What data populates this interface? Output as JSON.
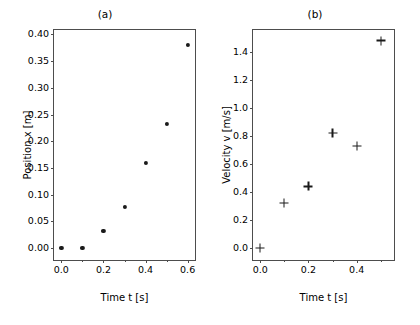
{
  "figure": {
    "width": 420,
    "height": 325,
    "background": "#ffffff",
    "marker_color": "#1a1a1a",
    "axis_color": "#4d4d4d"
  },
  "chart_data": [
    {
      "type": "scatter",
      "title": "(a)",
      "xlabel": "Time t [s]",
      "ylabel": "Position x [m]",
      "xlim": [
        -0.035,
        0.635
      ],
      "ylim": [
        -0.022,
        0.408
      ],
      "xticks": [
        0.0,
        0.2,
        0.4,
        0.6
      ],
      "xticklabels": [
        "0.0",
        "0.2",
        "0.4",
        "0.6"
      ],
      "xminorticks": [
        0.1,
        0.3,
        0.5
      ],
      "yticks": [
        0.0,
        0.05,
        0.1,
        0.15,
        0.2,
        0.25,
        0.3,
        0.35,
        0.4
      ],
      "yticklabels": [
        "0.00",
        "0.05",
        "0.10",
        "0.15",
        "0.20",
        "0.25",
        "0.30",
        "0.35",
        "0.40"
      ],
      "grid": false,
      "legend": null,
      "marker": "circle",
      "x": [
        0.0,
        0.1,
        0.2,
        0.3,
        0.4,
        0.5,
        0.6
      ],
      "y": [
        0.001,
        0.001,
        0.033,
        0.077,
        0.159,
        0.232,
        0.38
      ]
    },
    {
      "type": "scatter",
      "title": "(b)",
      "xlabel": "Time t [s]",
      "ylabel": "Velocity v [m/s]",
      "xlim": [
        -0.03,
        0.555
      ],
      "ylim": [
        -0.085,
        1.555
      ],
      "xticks": [
        0.0,
        0.2,
        0.4
      ],
      "xticklabels": [
        "0.0",
        "0.2",
        "0.4"
      ],
      "xminorticks": [
        0.1,
        0.3,
        0.5
      ],
      "yticks": [
        0.0,
        0.2,
        0.4,
        0.6,
        0.8,
        1.0,
        1.2,
        1.4
      ],
      "yticklabels": [
        "0.0",
        "0.2",
        "0.4",
        "0.6",
        "0.8",
        "1.0",
        "1.2",
        "1.4"
      ],
      "grid": false,
      "legend": null,
      "marker": "plus",
      "x": [
        0.0,
        0.1,
        0.2,
        0.3,
        0.4,
        0.5
      ],
      "y": [
        0.0,
        0.32,
        0.44,
        0.82,
        0.73,
        1.48
      ]
    }
  ]
}
